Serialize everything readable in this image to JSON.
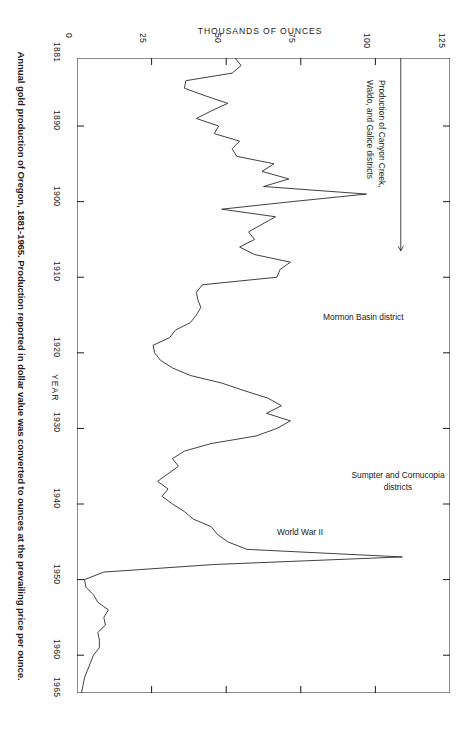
{
  "figure": {
    "caption": "Annual gold production of Oregon, 1881-1965. Production reported in dollar value was converted to ounces at the prevailing price per ounce.",
    "line_color": "#2b2b2b",
    "axis_color": "#1a1a1a",
    "background": "#ffffff"
  },
  "chart_data": {
    "type": "line",
    "title": "",
    "orientation": "horizontal-value-vertical-year",
    "xlabel": "THOUSANDS OF OUNCES",
    "ylabel": "YEAR",
    "xlim": [
      0,
      125
    ],
    "ylim": [
      1881,
      1965
    ],
    "xticks": [
      0,
      25,
      50,
      75,
      100,
      125
    ],
    "xtick_labels": [
      "0",
      "25",
      "50",
      "75",
      "100",
      "125"
    ],
    "yticks": [
      1881,
      1890,
      1900,
      1910,
      1920,
      1930,
      1940,
      1950,
      1960,
      1965
    ],
    "ytick_labels": [
      "1881",
      "1890",
      "1900",
      "1910",
      "1920",
      "1930",
      "1940",
      "1950",
      "1960",
      "1965"
    ],
    "grid": false,
    "legend": "none",
    "series": [
      {
        "name": "Annual gold production of Oregon",
        "units": "thousands of ounces",
        "x": [
          1881,
          1882,
          1883,
          1884,
          1885,
          1886,
          1887,
          1888,
          1889,
          1890,
          1891,
          1892,
          1893,
          1894,
          1895,
          1896,
          1897,
          1898,
          1899,
          1900,
          1901,
          1902,
          1903,
          1904,
          1905,
          1906,
          1907,
          1908,
          1909,
          1910,
          1911,
          1912,
          1913,
          1914,
          1915,
          1916,
          1917,
          1918,
          1919,
          1920,
          1921,
          1922,
          1923,
          1924,
          1925,
          1926,
          1927,
          1928,
          1929,
          1930,
          1931,
          1932,
          1933,
          1934,
          1935,
          1936,
          1937,
          1938,
          1939,
          1940,
          1941,
          1942,
          1943,
          1944,
          1945,
          1946,
          1947,
          1948,
          1949,
          1950,
          1951,
          1952,
          1953,
          1954,
          1955,
          1956,
          1957,
          1958,
          1959,
          1960,
          1961,
          1962,
          1963,
          1964,
          1965
        ],
        "y": [
          53.0,
          55.0,
          52.0,
          36.5,
          36.0,
          43.0,
          50.5,
          45.0,
          40.0,
          47.5,
          46.0,
          54.5,
          52.0,
          53.5,
          66.0,
          62.0,
          71.0,
          62.5,
          97.0,
          72.0,
          48.5,
          66.5,
          62.0,
          57.5,
          59.5,
          54.5,
          59.5,
          71.5,
          68.0,
          67.0,
          42.0,
          40.0,
          40.5,
          41.5,
          40.0,
          38.0,
          33.0,
          31.0,
          25.5,
          26.0,
          28.0,
          32.0,
          38.0,
          48.5,
          56.0,
          64.0,
          68.5,
          63.5,
          71.5,
          67.0,
          60.0,
          45.0,
          36.0,
          32.0,
          34.0,
          30.5,
          27.0,
          30.5,
          28.5,
          32.0,
          36.0,
          39.0,
          45.0,
          47.0,
          50.5,
          57.0,
          109.0,
          46.0,
          9.0,
          2.5,
          3.0,
          5.5,
          7.0,
          10.5,
          9.0,
          9.5,
          7.0,
          7.5,
          7.5,
          5.5,
          4.5,
          3.5,
          2.5,
          2.0,
          1.5
        ]
      }
    ],
    "annotations": [
      {
        "id": "canyon",
        "text": "Production of Canyon Creek,\nWaldo, and Galice districts",
        "points_to_year": 1899,
        "has_arrow": true
      },
      {
        "id": "mormon",
        "text": "Mormon Basin district",
        "points_to_year": 1914,
        "has_arrow": false
      },
      {
        "id": "sumpter",
        "text": "Sumpter and Cornucopia\ndistricts",
        "points_to_year": 1940,
        "has_arrow": false
      },
      {
        "id": "ww2",
        "text": "World War II",
        "points_to_year": 1943,
        "has_arrow": false
      }
    ]
  }
}
